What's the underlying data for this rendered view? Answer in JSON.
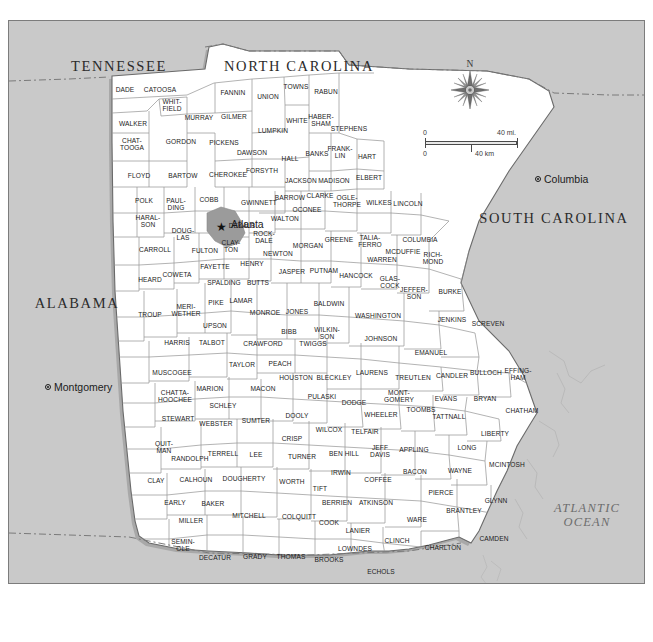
{
  "map": {
    "title": "Georgia County Map",
    "background_color": "#c9c9c9",
    "land_color": "#ffffff",
    "border_color": "#7c7c7c",
    "ocean_color": "#c9c9c9"
  },
  "compass": {
    "north_label": "N",
    "icon": "compass-rose-icon"
  },
  "scale": {
    "miles_zero": "0",
    "miles_max": "40 mi.",
    "km_zero": "0",
    "km_max": "40 km"
  },
  "neighbor_states": [
    {
      "name": "TENNESSEE",
      "x": 110,
      "y": 45
    },
    {
      "name": "NORTH CAROLINA",
      "x": 290,
      "y": 45
    },
    {
      "name": "SOUTH CAROLINA",
      "x": 545,
      "y": 197
    },
    {
      "name": "ALABAMA",
      "x": 68,
      "y": 282
    },
    {
      "name": "FLORIDA",
      "x": 350,
      "y": 597
    }
  ],
  "ocean_label": {
    "line1": "ATLANTIC",
    "line2": "OCEAN",
    "x": 578,
    "y": 494
  },
  "cities": [
    {
      "name": "Atlanta",
      "x": 212,
      "y": 206,
      "type": "state-capital-star",
      "label_dx": 10,
      "label_dy": -3
    },
    {
      "name": "Columbia",
      "x": 529,
      "y": 158,
      "type": "capital",
      "label_dx": 6,
      "label_dy": 0
    },
    {
      "name": "Montgomery",
      "x": 39,
      "y": 366,
      "type": "capital",
      "label_dx": 6,
      "label_dy": 0
    },
    {
      "name": "Tallahassee",
      "x": 228,
      "y": 585,
      "type": "capital",
      "label_dx": 6,
      "label_dy": -4
    },
    {
      "name": "Jacksonville",
      "x": 495,
      "y": 594,
      "type": "city",
      "label_dx": 4,
      "label_dy": 0
    }
  ],
  "counties": [
    {
      "name": "DADE",
      "x": 116,
      "y": 69
    },
    {
      "name": "CATOOSA",
      "x": 151,
      "y": 69
    },
    {
      "name": "WALKER",
      "x": 124,
      "y": 103
    },
    {
      "name": "WHIT-\nFIELD",
      "x": 163,
      "y": 85
    },
    {
      "name": "MURRAY",
      "x": 190,
      "y": 97
    },
    {
      "name": "FANNIN",
      "x": 224,
      "y": 72
    },
    {
      "name": "UNION",
      "x": 259,
      "y": 76
    },
    {
      "name": "TOWNS",
      "x": 287,
      "y": 66
    },
    {
      "name": "RABUN",
      "x": 317,
      "y": 71
    },
    {
      "name": "GILMER",
      "x": 225,
      "y": 96
    },
    {
      "name": "CHAT-\nTOOGA",
      "x": 123,
      "y": 124
    },
    {
      "name": "GORDON",
      "x": 172,
      "y": 121
    },
    {
      "name": "PICKENS",
      "x": 215,
      "y": 122
    },
    {
      "name": "DAWSON",
      "x": 243,
      "y": 132
    },
    {
      "name": "LUMPKIN",
      "x": 264,
      "y": 110
    },
    {
      "name": "WHITE",
      "x": 288,
      "y": 100
    },
    {
      "name": "HABER-\nSHAM",
      "x": 312,
      "y": 100
    },
    {
      "name": "STEPHENS",
      "x": 340,
      "y": 108
    },
    {
      "name": "FLOYD",
      "x": 130,
      "y": 155
    },
    {
      "name": "BARTOW",
      "x": 174,
      "y": 155
    },
    {
      "name": "CHEROKEE",
      "x": 219,
      "y": 154
    },
    {
      "name": "FORSYTH",
      "x": 253,
      "y": 150
    },
    {
      "name": "HALL",
      "x": 281,
      "y": 138
    },
    {
      "name": "BANKS",
      "x": 308,
      "y": 133
    },
    {
      "name": "FRANK-\nLIN",
      "x": 331,
      "y": 132
    },
    {
      "name": "HART",
      "x": 358,
      "y": 136
    },
    {
      "name": "POLK",
      "x": 135,
      "y": 180
    },
    {
      "name": "PAUL-\nDING",
      "x": 167,
      "y": 184
    },
    {
      "name": "COBB",
      "x": 200,
      "y": 179
    },
    {
      "name": "GWINNETT",
      "x": 250,
      "y": 182
    },
    {
      "name": "JACKSON",
      "x": 292,
      "y": 160
    },
    {
      "name": "MADISON",
      "x": 325,
      "y": 160
    },
    {
      "name": "ELBERT",
      "x": 360,
      "y": 157
    },
    {
      "name": "HARAL-\nSON",
      "x": 139,
      "y": 201
    },
    {
      "name": "DOUG-\nLAS",
      "x": 174,
      "y": 214
    },
    {
      "name": "FULTON",
      "x": 196,
      "y": 230
    },
    {
      "name": "DEKALB",
      "x": 233,
      "y": 205
    },
    {
      "name": "BARROW",
      "x": 281,
      "y": 177
    },
    {
      "name": "CLARKE",
      "x": 311,
      "y": 175
    },
    {
      "name": "OCONEE",
      "x": 298,
      "y": 189
    },
    {
      "name": "OGLE-\nTHORPE",
      "x": 338,
      "y": 181
    },
    {
      "name": "WILKES",
      "x": 370,
      "y": 182
    },
    {
      "name": "LINCOLN",
      "x": 399,
      "y": 183
    },
    {
      "name": "CARROLL",
      "x": 146,
      "y": 229
    },
    {
      "name": "CLAY-\nTON",
      "x": 222,
      "y": 226
    },
    {
      "name": "ROCK-\nDALE",
      "x": 255,
      "y": 217
    },
    {
      "name": "WALTON",
      "x": 276,
      "y": 198
    },
    {
      "name": "NEWTON",
      "x": 269,
      "y": 233
    },
    {
      "name": "MORGAN",
      "x": 299,
      "y": 225
    },
    {
      "name": "GREENE",
      "x": 330,
      "y": 219
    },
    {
      "name": "TALIA-\nFERRO",
      "x": 361,
      "y": 221
    },
    {
      "name": "COLUMBIA",
      "x": 411,
      "y": 219
    },
    {
      "name": "MCDUFFIE",
      "x": 394,
      "y": 231
    },
    {
      "name": "WARREN",
      "x": 373,
      "y": 239
    },
    {
      "name": "RICH-\nMOND",
      "x": 424,
      "y": 238
    },
    {
      "name": "FAYETTE",
      "x": 206,
      "y": 246
    },
    {
      "name": "HENRY",
      "x": 243,
      "y": 243
    },
    {
      "name": "JASPER",
      "x": 283,
      "y": 251
    },
    {
      "name": "PUTNAM",
      "x": 315,
      "y": 250
    },
    {
      "name": "HANCOCK",
      "x": 347,
      "y": 255
    },
    {
      "name": "GLAS-\nCOCK",
      "x": 381,
      "y": 262
    },
    {
      "name": "JEFFER-\nSON",
      "x": 405,
      "y": 273
    },
    {
      "name": "BURKE",
      "x": 441,
      "y": 271
    },
    {
      "name": "COWETA",
      "x": 168,
      "y": 254
    },
    {
      "name": "HEARD",
      "x": 141,
      "y": 259
    },
    {
      "name": "SPALDING",
      "x": 215,
      "y": 262
    },
    {
      "name": "BUTTS",
      "x": 249,
      "y": 262
    },
    {
      "name": "TROUP",
      "x": 141,
      "y": 294
    },
    {
      "name": "MERI-\nWETHER",
      "x": 177,
      "y": 290
    },
    {
      "name": "PIKE",
      "x": 207,
      "y": 282
    },
    {
      "name": "LAMAR",
      "x": 232,
      "y": 280
    },
    {
      "name": "MONROE",
      "x": 256,
      "y": 292
    },
    {
      "name": "JONES",
      "x": 288,
      "y": 291
    },
    {
      "name": "BALDWIN",
      "x": 320,
      "y": 283
    },
    {
      "name": "WASHINGTON",
      "x": 369,
      "y": 295
    },
    {
      "name": "JENKINS",
      "x": 443,
      "y": 299
    },
    {
      "name": "SCREVEN",
      "x": 479,
      "y": 303
    },
    {
      "name": "UPSON",
      "x": 206,
      "y": 305
    },
    {
      "name": "BIBB",
      "x": 280,
      "y": 311
    },
    {
      "name": "WILKIN-\nSON",
      "x": 318,
      "y": 313
    },
    {
      "name": "JOHNSON",
      "x": 372,
      "y": 318
    },
    {
      "name": "EMANUEL",
      "x": 422,
      "y": 332
    },
    {
      "name": "HARRIS",
      "x": 168,
      "y": 322
    },
    {
      "name": "TALBOT",
      "x": 203,
      "y": 322
    },
    {
      "name": "CRAWFORD",
      "x": 254,
      "y": 323
    },
    {
      "name": "TWIGGS",
      "x": 304,
      "y": 323
    },
    {
      "name": "MUSCOGEE",
      "x": 163,
      "y": 352
    },
    {
      "name": "TAYLOR",
      "x": 233,
      "y": 344
    },
    {
      "name": "PEACH",
      "x": 271,
      "y": 343
    },
    {
      "name": "HOUSTON",
      "x": 287,
      "y": 357
    },
    {
      "name": "BLECKLEY",
      "x": 325,
      "y": 357
    },
    {
      "name": "LAURENS",
      "x": 363,
      "y": 352
    },
    {
      "name": "TREUTLEN",
      "x": 404,
      "y": 357
    },
    {
      "name": "CANDLER",
      "x": 443,
      "y": 355
    },
    {
      "name": "BULLOCH",
      "x": 477,
      "y": 352
    },
    {
      "name": "EFFING-\nHAM",
      "x": 509,
      "y": 354
    },
    {
      "name": "CHATTA-\nHOOCHEE",
      "x": 166,
      "y": 376
    },
    {
      "name": "MARION",
      "x": 201,
      "y": 368
    },
    {
      "name": "MACON",
      "x": 254,
      "y": 368
    },
    {
      "name": "SCHLEY",
      "x": 214,
      "y": 385
    },
    {
      "name": "PULASKI",
      "x": 313,
      "y": 376
    },
    {
      "name": "DODGE",
      "x": 345,
      "y": 382
    },
    {
      "name": "MONT-\nGOMERY",
      "x": 390,
      "y": 376
    },
    {
      "name": "WHEELER",
      "x": 372,
      "y": 394
    },
    {
      "name": "EVANS",
      "x": 437,
      "y": 378
    },
    {
      "name": "BRYAN",
      "x": 476,
      "y": 378
    },
    {
      "name": "TOOMBS",
      "x": 412,
      "y": 389
    },
    {
      "name": "TATTNALL",
      "x": 440,
      "y": 396
    },
    {
      "name": "CHATHAM",
      "x": 513,
      "y": 390
    },
    {
      "name": "STEWART",
      "x": 169,
      "y": 398
    },
    {
      "name": "WEBSTER",
      "x": 207,
      "y": 403
    },
    {
      "name": "SUMTER",
      "x": 247,
      "y": 400
    },
    {
      "name": "DOOLY",
      "x": 288,
      "y": 395
    },
    {
      "name": "WILCOX",
      "x": 320,
      "y": 409
    },
    {
      "name": "TELFAIR",
      "x": 356,
      "y": 411
    },
    {
      "name": "LIBERTY",
      "x": 486,
      "y": 413
    },
    {
      "name": "QUIT-\nMAN",
      "x": 155,
      "y": 427
    },
    {
      "name": "CRISP",
      "x": 283,
      "y": 418
    },
    {
      "name": "RANDOLPH",
      "x": 181,
      "y": 438
    },
    {
      "name": "TERRELL",
      "x": 214,
      "y": 433
    },
    {
      "name": "LEE",
      "x": 247,
      "y": 434
    },
    {
      "name": "TURNER",
      "x": 293,
      "y": 436
    },
    {
      "name": "BEN HILL",
      "x": 335,
      "y": 433
    },
    {
      "name": "JEFF\nDAVIS",
      "x": 371,
      "y": 431
    },
    {
      "name": "APPLING",
      "x": 405,
      "y": 429
    },
    {
      "name": "LONG",
      "x": 458,
      "y": 427
    },
    {
      "name": "MCINTOSH",
      "x": 498,
      "y": 444
    },
    {
      "name": "CLAY",
      "x": 147,
      "y": 460
    },
    {
      "name": "CALHOUN",
      "x": 187,
      "y": 459
    },
    {
      "name": "DOUGHERTY",
      "x": 235,
      "y": 458
    },
    {
      "name": "WORTH",
      "x": 283,
      "y": 461
    },
    {
      "name": "TIFT",
      "x": 311,
      "y": 468
    },
    {
      "name": "IRWIN",
      "x": 332,
      "y": 452
    },
    {
      "name": "COFFEE",
      "x": 369,
      "y": 459
    },
    {
      "name": "BACON",
      "x": 406,
      "y": 451
    },
    {
      "name": "WAYNE",
      "x": 451,
      "y": 450
    },
    {
      "name": "EARLY",
      "x": 166,
      "y": 482
    },
    {
      "name": "BAKER",
      "x": 204,
      "y": 483
    },
    {
      "name": "MITCHELL",
      "x": 240,
      "y": 495
    },
    {
      "name": "COLQUITT",
      "x": 290,
      "y": 496
    },
    {
      "name": "BERRIEN",
      "x": 328,
      "y": 482
    },
    {
      "name": "ATKINSON",
      "x": 367,
      "y": 482
    },
    {
      "name": "COOK",
      "x": 320,
      "y": 502
    },
    {
      "name": "PIERCE",
      "x": 432,
      "y": 472
    },
    {
      "name": "BRANTLEY",
      "x": 455,
      "y": 490
    },
    {
      "name": "GLYNN",
      "x": 487,
      "y": 480
    },
    {
      "name": "MILLER",
      "x": 182,
      "y": 500
    },
    {
      "name": "WARE",
      "x": 408,
      "y": 499
    },
    {
      "name": "LANIER",
      "x": 349,
      "y": 510
    },
    {
      "name": "SEMIN-\nOLE",
      "x": 174,
      "y": 525
    },
    {
      "name": "DECATUR",
      "x": 206,
      "y": 537
    },
    {
      "name": "GRADY",
      "x": 246,
      "y": 536
    },
    {
      "name": "THOMAS",
      "x": 282,
      "y": 536
    },
    {
      "name": "BROOKS",
      "x": 320,
      "y": 539
    },
    {
      "name": "LOWNDES",
      "x": 346,
      "y": 528
    },
    {
      "name": "CLINCH",
      "x": 388,
      "y": 520
    },
    {
      "name": "CHARLTON",
      "x": 434,
      "y": 527
    },
    {
      "name": "CAMDEN",
      "x": 485,
      "y": 518
    },
    {
      "name": "ECHOLS",
      "x": 372,
      "y": 551
    }
  ]
}
